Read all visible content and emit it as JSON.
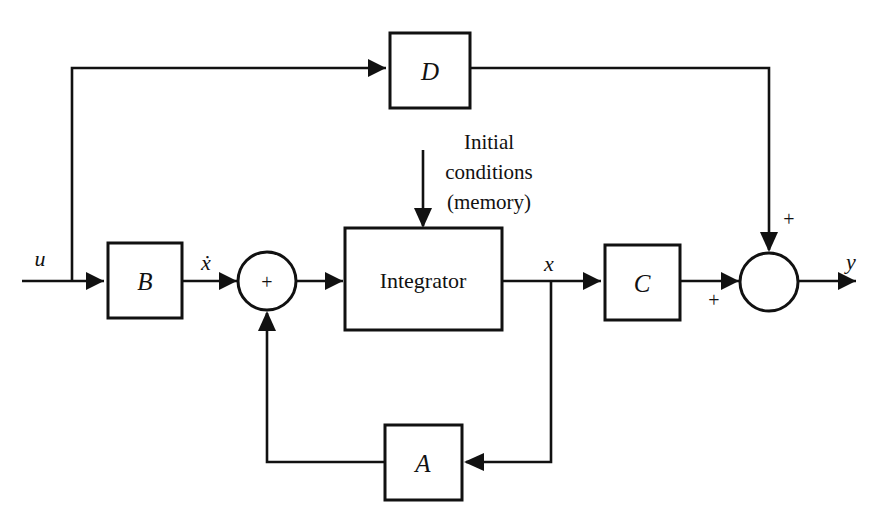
{
  "diagram": {
    "type": "control-system-block-diagram",
    "line_color": "#111111",
    "fill_color": "#ffffff",
    "background": "#ffffff"
  },
  "blocks": {
    "d": {
      "label": "D",
      "name": "feedthrough-matrix"
    },
    "b": {
      "label": "B",
      "name": "input-matrix"
    },
    "a": {
      "label": "A",
      "name": "system-matrix"
    },
    "c": {
      "label": "C",
      "name": "output-matrix"
    },
    "integrator": {
      "label": "Integrator",
      "name": "integrator"
    }
  },
  "summing_junctions": {
    "left": {
      "sign": "+",
      "name": "state-derivative-sum"
    },
    "right": {
      "sign": "+",
      "name": "output-sum"
    }
  },
  "signals": {
    "input": "u",
    "state_derivative": "ẋ",
    "state": "x",
    "output": "y"
  },
  "sign_markers": {
    "left_sum_center": "+",
    "right_sum_top": "+",
    "right_sum_left": "+"
  },
  "annotations": {
    "initial_conditions": {
      "line1": "Initial",
      "line2": "conditions",
      "line3": "(memory)"
    }
  }
}
